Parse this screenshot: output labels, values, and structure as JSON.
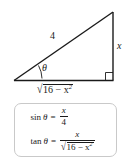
{
  "diagram": {
    "type": "right-triangle",
    "labels": {
      "hypotenuse": "4",
      "opposite": "x",
      "angle": "θ",
      "adjacent_prefix": "16 − x",
      "adjacent_exponent": "2",
      "adjacent_full": "√(16 − x²)"
    },
    "right_angle_marker": "square",
    "stroke_color": "#1a1a1a"
  },
  "formulas": {
    "box_border_color": "#c9c9c9",
    "items": [
      {
        "function": "sin",
        "angle": "θ",
        "equals": "=",
        "numerator": "x",
        "denominator": "4",
        "text": "sin θ = x/4"
      },
      {
        "function": "tan",
        "angle": "θ",
        "equals": "=",
        "numerator": "x",
        "denominator_prefix": "16 − x",
        "denominator_exponent": "2",
        "text": "tan θ = x/√(16 − x²)"
      }
    ]
  }
}
